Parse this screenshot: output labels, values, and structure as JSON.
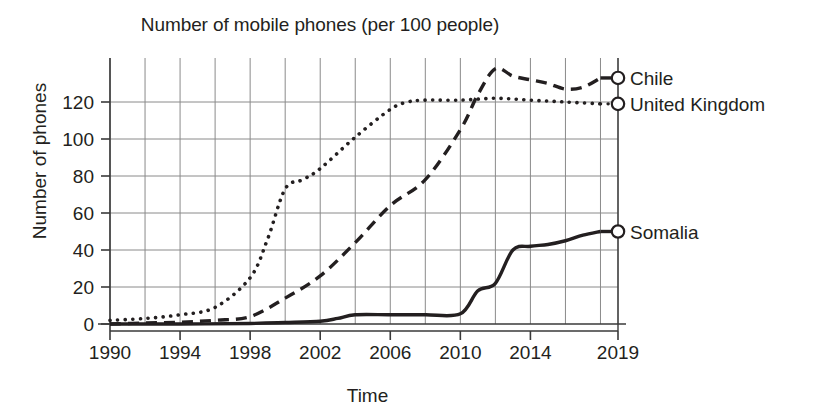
{
  "chart_data": {
    "type": "line",
    "title": "Number of mobile phones (per 100 people)",
    "xlabel": "Time",
    "ylabel": "Number of phones",
    "xlim": [
      1990,
      2019
    ],
    "ylim": [
      0,
      133
    ],
    "yticks": [
      0,
      20,
      40,
      60,
      80,
      100,
      120
    ],
    "xticks": [
      1990,
      1994,
      1998,
      2002,
      2006,
      2010,
      2014,
      2019
    ],
    "xtick_labels": [
      "1990",
      "1994",
      "1998",
      "2002",
      "2006",
      "2010",
      "2014",
      "2019"
    ],
    "ytick_labels": [
      "0",
      "20",
      "40",
      "60",
      "80",
      "100",
      "120"
    ],
    "grid": true,
    "grid_x_step": 2,
    "legend_position": "right-inline-end-of-line",
    "end_marker": "open-circle",
    "series": [
      {
        "name": "Chile",
        "style": "dashed",
        "color": "#231f20",
        "label_x": 2019,
        "x": [
          1990,
          1992,
          1994,
          1996,
          1998,
          2000,
          2002,
          2004,
          2006,
          2008,
          2010,
          2011,
          2012,
          2013,
          2014,
          2015,
          2016,
          2017,
          2018
        ],
        "y": [
          0,
          0.5,
          1,
          2,
          4,
          14,
          26,
          44,
          64,
          78,
          105,
          124,
          138,
          134,
          132,
          130,
          127,
          128,
          133
        ]
      },
      {
        "name": "United Kingdom",
        "style": "dotted",
        "color": "#231f20",
        "label_x": 2019,
        "x": [
          1990,
          1992,
          1994,
          1996,
          1998,
          1999,
          2000,
          2001,
          2002,
          2004,
          2006,
          2007,
          2008,
          2010,
          2012,
          2014,
          2016,
          2018
        ],
        "y": [
          2,
          3,
          5,
          9,
          25,
          46,
          73,
          78,
          84,
          101,
          116,
          120,
          121,
          121,
          122,
          121,
          120,
          119
        ]
      },
      {
        "name": "Somalia",
        "style": "solid",
        "color": "#231f20",
        "label_x": 2019,
        "x": [
          1990,
          1994,
          1998,
          2000,
          2002,
          2003,
          2004,
          2006,
          2008,
          2010,
          2011,
          2012,
          2013,
          2014,
          2015,
          2016,
          2017,
          2018
        ],
        "y": [
          0,
          0,
          0.3,
          0.8,
          1.5,
          3,
          5,
          5,
          5,
          5.5,
          18,
          22,
          40,
          42,
          43,
          45,
          48,
          50
        ]
      }
    ]
  }
}
